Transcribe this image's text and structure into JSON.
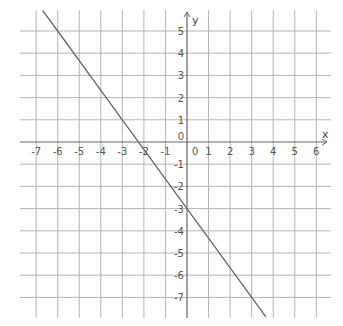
{
  "chart_data": {
    "type": "line",
    "title": "",
    "xlabel": "x",
    "ylabel": "y",
    "xlim": [
      -7,
      6
    ],
    "ylim": [
      -7,
      5
    ],
    "grid": true,
    "x_ticks": [
      -7,
      -6,
      -5,
      -4,
      -3,
      -2,
      -1,
      0,
      1,
      2,
      3,
      4,
      5,
      6
    ],
    "y_ticks": [
      5,
      4,
      3,
      2,
      1,
      0,
      -1,
      -2,
      -3,
      -4,
      -5,
      -6,
      -7
    ],
    "series": [
      {
        "name": "line",
        "equation": "y = -4/3 x - 3",
        "slope": -1.3333,
        "intercept": -3,
        "x": [
          -6.7,
          -6,
          -3,
          0,
          3,
          3.66
        ],
        "y": [
          5.93,
          5,
          1,
          -3,
          -7,
          -7.88
        ],
        "color": "#666666"
      }
    ]
  },
  "colors": {
    "grid": "#b5b5b5",
    "axis": "#666666",
    "line": "#666666",
    "text": "#555555"
  }
}
